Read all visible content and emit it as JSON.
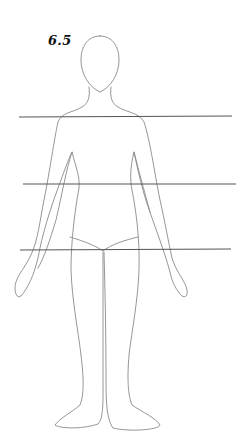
{
  "figure": {
    "label": "6.5",
    "outline_color": "#8a8a8a",
    "line_color": "#555555"
  },
  "lines": [
    {
      "name": "shoulder-line",
      "x1": 19,
      "y1": 117,
      "x2": 232,
      "y2": 116
    },
    {
      "name": "waist-line",
      "x1": 23,
      "y1": 184,
      "x2": 236,
      "y2": 184
    },
    {
      "name": "hip-line",
      "x1": 20,
      "y1": 250,
      "x2": 231,
      "y2": 249
    }
  ]
}
